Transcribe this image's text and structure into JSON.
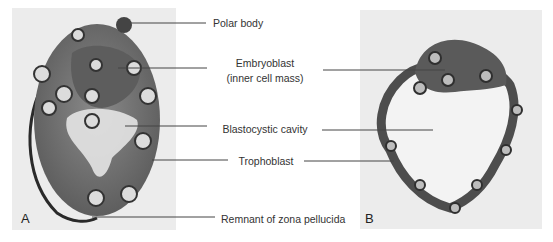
{
  "figure": {
    "panels": [
      {
        "id": "A",
        "letter": "A",
        "description": "early blastocyst micrograph"
      },
      {
        "id": "B",
        "letter": "B",
        "description": "later blastocyst micrograph"
      }
    ],
    "labels": {
      "polar_body": "Polar body",
      "embryoblast": "Embryoblast",
      "embryoblast_sub": "(inner cell mass)",
      "blastocystic_cavity": "Blastocystic cavity",
      "trophoblast": "Trophoblast",
      "zona_remnant": "Remnant of zona pellucida"
    },
    "colors": {
      "panel_background": "#ececec",
      "tissue_dark": "#555555",
      "tissue_mid": "#7a7a7a",
      "cavity": "#efefef",
      "leader_line": "#444444"
    }
  }
}
